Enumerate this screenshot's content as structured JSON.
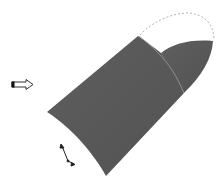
{
  "diagram": {
    "type": "3d-surface-sweep",
    "description": "Shaded swept surface with a seam curve, a dashed guide arc, a direction arrow, and a small axis triad",
    "colors": {
      "background": "#ffffff",
      "surface_fill": "#5a5a5a",
      "surface_edge": "#4a4a4a",
      "seam_line": "#9a9a9a",
      "guide_arc": "#b4b4b4",
      "arrow_stroke": "#333333",
      "arrow_tail": "#111111",
      "triad": "#222222"
    },
    "elements": [
      {
        "id": "direction-arrow",
        "label": "Direction arrow",
        "position": [
          11,
          80,
          33,
          89
        ]
      },
      {
        "id": "surface-main",
        "label": "Swept surface (main section)"
      },
      {
        "id": "surface-lobe",
        "label": "Swept surface (end lobe)"
      },
      {
        "id": "seam-curve",
        "label": "Section seam curve"
      },
      {
        "id": "guide-arc",
        "label": "Dashed guide arc"
      },
      {
        "id": "axis-triad",
        "label": "Axis triad",
        "position": [
          60,
          143,
          75,
          165
        ]
      }
    ]
  }
}
